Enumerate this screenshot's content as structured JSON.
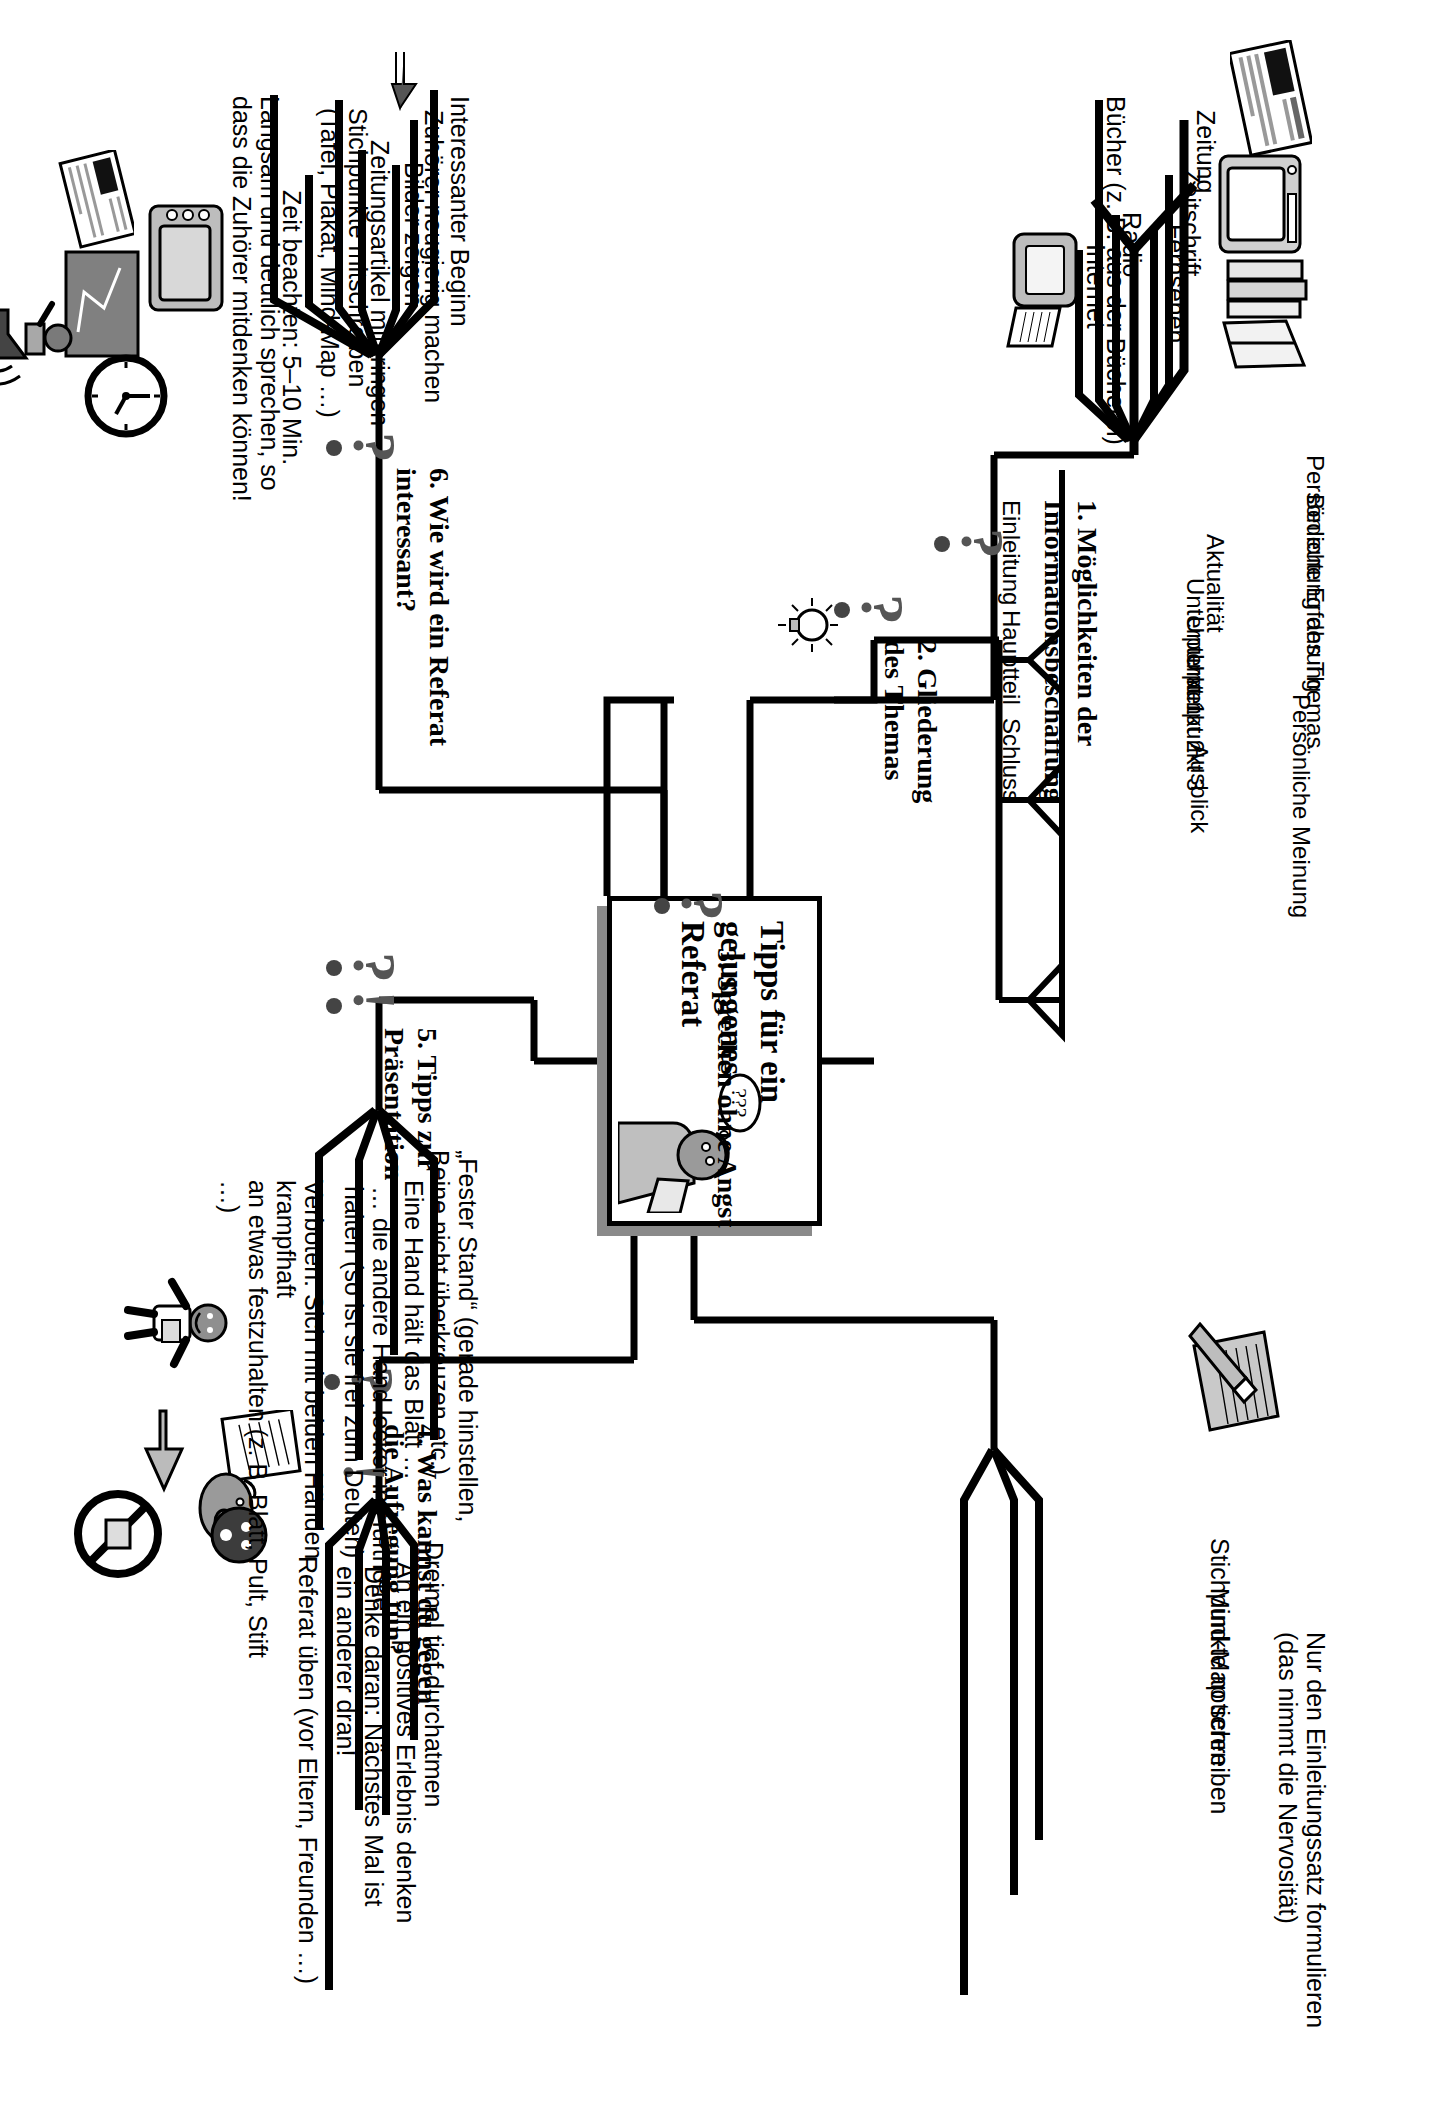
{
  "center": {
    "title": "Tipps für ein\ngelungenes\nReferat",
    "icon": "thinking-pupil-icon",
    "speech_bubble": "???"
  },
  "branches": [
    {
      "number": "1.",
      "title": "1.  Möglichkeiten der\nInformationsbeschaffung",
      "marker": "question-mark-icon",
      "children": [
        {
          "label": "Zeitung",
          "icon": "newspaper-icon"
        },
        {
          "label": "Zeitschrift",
          "icon": "magazine-icon"
        },
        {
          "label": "Fernsehen",
          "icon": "television-icon"
        },
        {
          "label": "Radio",
          "icon": ""
        },
        {
          "label": "Bücher (z. B. aus der Bücherei)",
          "icon": "books-icon"
        },
        {
          "label": "Internet",
          "icon": "computer-icon"
        }
      ]
    },
    {
      "number": "2.",
      "title": "2.  Gliederung\ndes Themas",
      "marker": "question-mark-icon",
      "extra_icon": "lightbulb-icon",
      "children": [
        {
          "label": "Einleitung",
          "sub": [
            "Persönliche Erfahrung",
            "Bedeutung des Themas",
            "Aktualität"
          ]
        },
        {
          "label": "Hauptteil",
          "sub": [
            "Unterpunkt 1",
            "Unterpunkt 2",
            "Unterpunkt 3"
          ]
        },
        {
          "label": "Schluss",
          "sub": [
            "Persönliche Meinung",
            "Ausblick"
          ]
        }
      ]
    },
    {
      "number": "3.",
      "title": "3.  Sprechen ohne Angst",
      "marker": "question-mark-icon",
      "children": [
        {
          "label": "Stichpunkte notieren",
          "icon": "note-pencil-icon"
        },
        {
          "label": "Mind-Map schreiben",
          "icon": ""
        },
        {
          "label": "Nur den Einleitungssatz formulieren\n(das nimmt die Nervosität)",
          "icon": ""
        }
      ]
    },
    {
      "number": "4.",
      "title": "4.  Was kannst du gegen\ndie Aufregung tun?",
      "marker": "question-mark-icon",
      "children": [
        {
          "label": "Dreimal tief durchatmen",
          "icon": ""
        },
        {
          "label": "An ein positives Erlebnis denken",
          "icon": "thinking-piggy-icon"
        },
        {
          "label": "Denke daran: Nächstes Mal ist\nein anderer dran!",
          "icon": "exclamation-face-icon"
        },
        {
          "label": "Referat üben (vor Eltern, Freunden …)",
          "icon": ""
        }
      ]
    },
    {
      "number": "5.",
      "title": "5.  Tipps zur\nPräsentation",
      "marker": "question-exclamation-icon",
      "children": [
        {
          "label": "„Fester Stand“ (gerade hinstellen,\nBeine nicht überkreuzen etc.)",
          "icon": "standing-boy-icon"
        },
        {
          "label": "Eine Hand hält das Blatt …",
          "icon": ""
        },
        {
          "label": "… die andere Hand locker in Hüfthöhe\nhalten (so ist sie frei zum Deuten)",
          "icon": "pointing-hand-icon"
        },
        {
          "label": "Verboten: Sich mit beiden Händen krampfhaft\nan etwas festzuhalten (z. B. Blatt, Pult, Stift …)",
          "icon": "no-entry-icon"
        }
      ]
    },
    {
      "number": "6.",
      "title": "6.  Wie wird ein Referat\ninteressant?",
      "marker": "question-mark-icon",
      "children": [
        {
          "label": "Interessanter Beginn",
          "icon": "arrow-up-icon"
        },
        {
          "label": "Zuhörer neugierig machen",
          "icon": ""
        },
        {
          "label": "Bilder zeigen",
          "icon": "overhead-projector-icon"
        },
        {
          "label": "Zeitungsartikel mitbringen",
          "icon": "newspaper-small-icon"
        },
        {
          "label": "Stichpunkte mitschreiben\n(Tafel, Plakat, Mind-Map …)",
          "icon": "blackboard-icon"
        },
        {
          "label": "Zeit beachten: 5–10 Min.",
          "icon": "clock-icon"
        },
        {
          "label": "Langsam und deutlich sprechen, so\ndass die Zuhörer mitdenken können!",
          "icon": "megaphone-icon"
        }
      ]
    }
  ],
  "colors": {
    "ink": "#000000",
    "shadow": "#8a8a8a",
    "marker": "#555555",
    "paper": "#ffffff"
  }
}
